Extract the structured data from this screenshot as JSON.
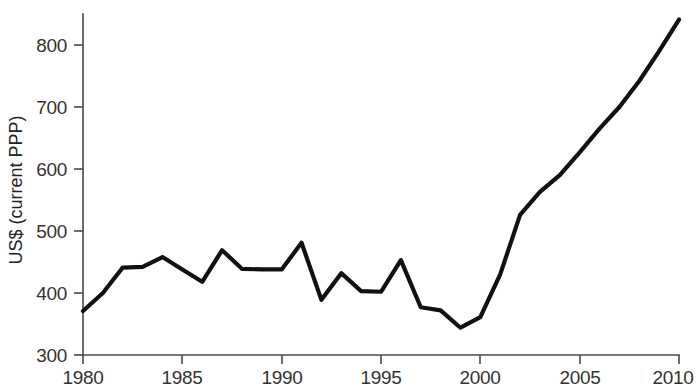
{
  "chart_data": {
    "type": "line",
    "title": "",
    "subtitle": "",
    "xlabel": "",
    "ylabel": "US$ (current PPP)",
    "xlim": [
      1980,
      2010
    ],
    "ylim": [
      300,
      850
    ],
    "xticks": [
      1980,
      1985,
      1990,
      1995,
      2000,
      2005,
      2010
    ],
    "xtick_labels": [
      "1980",
      "1985",
      "1990",
      "1995",
      "2000",
      "2005",
      "2010"
    ],
    "yticks": [
      300,
      400,
      500,
      600,
      700,
      800
    ],
    "ytick_labels": [
      "300",
      "400",
      "500",
      "600",
      "700",
      "800"
    ],
    "grid": false,
    "legend": null,
    "legend_position": "none",
    "line_color": "#111111",
    "axis_color": "#4a4a4a",
    "background_color": "#ffffff",
    "x": [
      1980,
      1981,
      1982,
      1983,
      1984,
      1985,
      1986,
      1987,
      1988,
      1989,
      1990,
      1991,
      1992,
      1993,
      1994,
      1995,
      1996,
      1997,
      1998,
      1999,
      2000,
      2001,
      2002,
      2003,
      2004,
      2005,
      2006,
      2007,
      2008,
      2009,
      2010
    ],
    "values": [
      371,
      400,
      441,
      442,
      458,
      438,
      418,
      469,
      439,
      438,
      438,
      481,
      389,
      432,
      403,
      402,
      453,
      377,
      372,
      344,
      361,
      430,
      526,
      563,
      590,
      627,
      665,
      700,
      742,
      790,
      841
    ]
  },
  "axis": {
    "y_title": "US$ (current PPP)"
  }
}
